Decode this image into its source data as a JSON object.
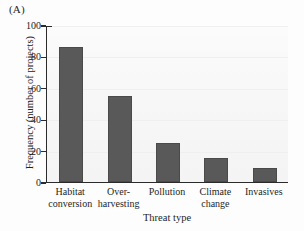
{
  "figure": {
    "panel_label": "(A)"
  },
  "chart_data": {
    "type": "bar",
    "title": "",
    "panel": "(A)",
    "categories": [
      "Habitat conversion",
      "Over-harvesting",
      "Pollution",
      "Climate change",
      "Invasives"
    ],
    "category_lines": [
      [
        "Habitat",
        "conversion"
      ],
      [
        "Over-",
        "harvesting"
      ],
      [
        "Pollution",
        ""
      ],
      [
        "Climate",
        "change"
      ],
      [
        "Invasives",
        ""
      ]
    ],
    "values": [
      86,
      55,
      25,
      15,
      9
    ],
    "xlabel": "Threat type",
    "ylabel": "Frequency (number of projects)",
    "ylim": [
      0,
      100
    ],
    "yticks": [
      0,
      20,
      40,
      60,
      80,
      100
    ],
    "ytick_labels": [
      "0",
      "20",
      "40",
      "60",
      "80",
      "100"
    ],
    "grid": true,
    "legend": "none",
    "bar_color": "#595959",
    "plot_background": "#f7f7f7",
    "axis_color": "#2b2b2b"
  }
}
